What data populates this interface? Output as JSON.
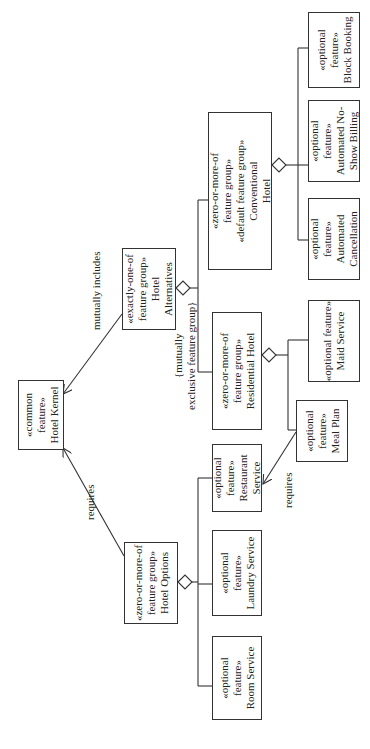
{
  "diagram": {
    "nodes": {
      "hotel_kernel": {
        "stereotype": "«common feature»",
        "stereo_l1": "«common",
        "stereo_l2": "feature»",
        "name": "Hotel Kernel"
      },
      "hotel_alternatives": {
        "stereo_l1": "«exactly-one-of",
        "stereo_l2": "feature group»",
        "name_l1": "Hotel",
        "name_l2": "Alternatives"
      },
      "conventional_hotel": {
        "stereo_l1": "«zero-or-more-of",
        "stereo_l2": "feature group»",
        "stereo_l3": "«default feature group»",
        "name_l1": "Conventional",
        "name_l2": "Hotel"
      },
      "block_booking": {
        "stereo_l1": "«optional",
        "stereo_l2": "feature»",
        "name": "Block Booking"
      },
      "automated_no_show_billing": {
        "stereo_l1": "«optional",
        "stereo_l2": "feature»",
        "name_l1": "Automated No-",
        "name_l2": "Show Billing"
      },
      "automated_cancellation": {
        "stereo_l1": "«optional",
        "stereo_l2": "feature»",
        "name_l1": "Automated",
        "name_l2": "Cancellation"
      },
      "residential_hotel": {
        "stereo_l1": "«zero-or-more-of",
        "stereo_l2": "feature group»",
        "name": "Residential Hotel"
      },
      "maid_service": {
        "stereo": "«optional feature»",
        "name": "Maid Service"
      },
      "meal_plan": {
        "stereo_l1": "«optional",
        "stereo_l2": "feature»",
        "name": "Meal Plan"
      },
      "hotel_options": {
        "stereo_l1": "«zero-or-more-of",
        "stereo_l2": "feature group»",
        "name": "Hotel Options"
      },
      "restaurant_service": {
        "stereo_l1": "«optional",
        "stereo_l2": "feature»",
        "name_l1": "Restaurant",
        "name_l2": "Service"
      },
      "laundry_service": {
        "stereo_l1": "«optional",
        "stereo_l2": "feature»",
        "name": "Laundry Service"
      },
      "room_service": {
        "stereo_l1": "«optional",
        "stereo_l2": "feature»",
        "name": "Room Service"
      }
    },
    "edge_labels": {
      "mutually_includes": "mutually includes",
      "requires_options": "requires",
      "requires_meal": "requires",
      "constraint_l1": "{mutually",
      "constraint_l2": "exclusive feature group}"
    },
    "colors": {
      "line": "#333333",
      "background": "#ffffff",
      "text": "#222222"
    }
  }
}
